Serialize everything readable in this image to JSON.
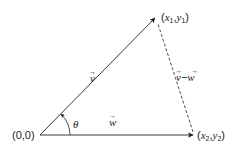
{
  "diagram": {
    "type": "vector-subtraction",
    "colors": {
      "stroke": "#222222",
      "background": "#ffffff"
    },
    "points": {
      "origin": {
        "label": "(0,0)"
      },
      "p1": {
        "label_open": "(",
        "x": "x",
        "x_sub": "1",
        "comma": ",",
        "y": "y",
        "y_sub": "1",
        "label_close": ")"
      },
      "p2": {
        "label_open": "(",
        "x": "x",
        "x_sub": "2",
        "comma": ",",
        "y": "y",
        "y_sub": "2",
        "label_close": ")"
      }
    },
    "vectors": {
      "v": {
        "label": "v",
        "style": "solid",
        "from": "origin",
        "to": "p1"
      },
      "w": {
        "label": "w",
        "style": "solid",
        "from": "origin",
        "to": "p2"
      },
      "v_minus_w": {
        "label_v": "v",
        "operator": "−",
        "label_w": "w",
        "style": "dashed",
        "from": "p2",
        "to": "p1"
      }
    },
    "angle": {
      "label": "θ",
      "between": [
        "w",
        "v"
      ]
    },
    "arrow_symbol": "→"
  }
}
